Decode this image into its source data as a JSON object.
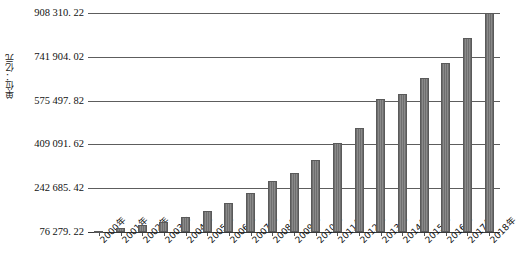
{
  "chart_data": {
    "type": "bar",
    "title": "",
    "subtitle": "",
    "xlabel": "",
    "ylabel": "单位：亿元",
    "categories": [
      "2000年",
      "2001年",
      "2002年",
      "2003年",
      "2004年",
      "2005年",
      "2006年",
      "2007年",
      "2008年",
      "2009年",
      "2010年",
      "2011年",
      "2012年",
      "2013年",
      "2014年",
      "2015年",
      "2016年",
      "2017年",
      "2018年"
    ],
    "values": [
      80000,
      91000,
      102000,
      115000,
      135000,
      157000,
      185000,
      225000,
      270000,
      300000,
      350000,
      415000,
      470000,
      580000,
      600000,
      660000,
      720000,
      815000,
      908310
    ],
    "ytick_labels": [
      "908 310. 22",
      "741 904. 02",
      "575 497. 82",
      "409 091. 62",
      "242 685. 42",
      "76 279. 22"
    ],
    "ytick_values": [
      908310.22,
      741904.02,
      575497.82,
      409091.62,
      242685.42,
      76279.22
    ],
    "ylim": [
      76279.22,
      908310.22
    ],
    "grid": true,
    "legend": "none",
    "bar_color": "#7a7a7a",
    "grid_color": "#5d5d5d"
  }
}
